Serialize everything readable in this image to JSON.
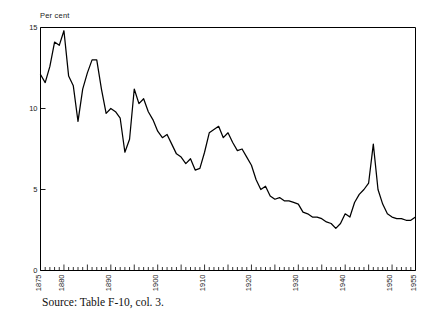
{
  "figure": {
    "unit_label": "Per cent",
    "source_caption": "Source:  Table F-10, col. 3."
  },
  "chart_data": {
    "type": "line",
    "title": "",
    "subtitle": "",
    "xlabel": "",
    "ylabel": "Per cent",
    "xlim": [
      1875,
      1955
    ],
    "ylim": [
      0,
      15
    ],
    "grid": false,
    "legend": null,
    "line_color": "#000000",
    "axis_color": "#000000",
    "y_ticks": [
      0,
      5,
      10,
      15
    ],
    "y_tick_labels": [
      "0",
      "5",
      "10",
      "15"
    ],
    "x_major_ticks": [
      1875,
      1880,
      1890,
      1900,
      1910,
      1920,
      1930,
      1940,
      1950,
      1955
    ],
    "x_major_tick_labels": [
      "1875",
      "1880",
      "1890",
      "1900",
      "1910",
      "1920",
      "1930",
      "1940",
      "1950",
      "1955"
    ],
    "x_minor_tick_interval": 1,
    "x": [
      1875,
      1876,
      1877,
      1878,
      1879,
      1880,
      1881,
      1882,
      1883,
      1884,
      1885,
      1886,
      1887,
      1888,
      1889,
      1890,
      1891,
      1892,
      1893,
      1894,
      1895,
      1896,
      1897,
      1898,
      1899,
      1900,
      1901,
      1902,
      1903,
      1904,
      1905,
      1906,
      1907,
      1908,
      1909,
      1910,
      1911,
      1912,
      1913,
      1914,
      1915,
      1916,
      1917,
      1918,
      1919,
      1920,
      1921,
      1922,
      1923,
      1924,
      1925,
      1926,
      1927,
      1928,
      1929,
      1930,
      1931,
      1932,
      1933,
      1934,
      1935,
      1936,
      1937,
      1938,
      1939,
      1940,
      1941,
      1942,
      1943,
      1944,
      1945,
      1946,
      1947,
      1948,
      1949,
      1950,
      1951,
      1952,
      1953,
      1954,
      1955
    ],
    "y": [
      12.1,
      11.6,
      12.6,
      14.1,
      13.9,
      14.8,
      12.0,
      11.4,
      9.2,
      11.2,
      12.2,
      13.0,
      13.0,
      11.2,
      9.7,
      10.0,
      9.8,
      9.4,
      7.3,
      8.1,
      11.2,
      10.3,
      10.6,
      9.8,
      9.3,
      8.6,
      8.2,
      8.4,
      7.8,
      7.2,
      7.0,
      6.6,
      6.9,
      6.2,
      6.3,
      7.3,
      8.5,
      8.7,
      8.9,
      8.2,
      8.5,
      7.9,
      7.4,
      7.5,
      7.0,
      6.5,
      5.6,
      5.0,
      5.2,
      4.6,
      4.4,
      4.5,
      4.3,
      4.3,
      4.2,
      4.1,
      3.6,
      3.5,
      3.3,
      3.3,
      3.2,
      3.0,
      2.9,
      2.6,
      2.9,
      3.5,
      3.3,
      4.2,
      4.7,
      5.0,
      5.4,
      7.8,
      5.0,
      4.1,
      3.5,
      3.3,
      3.2,
      3.2,
      3.1,
      3.1,
      3.3,
      3.7,
      3.2,
      3.5,
      3.3
    ],
    "annotations": []
  }
}
